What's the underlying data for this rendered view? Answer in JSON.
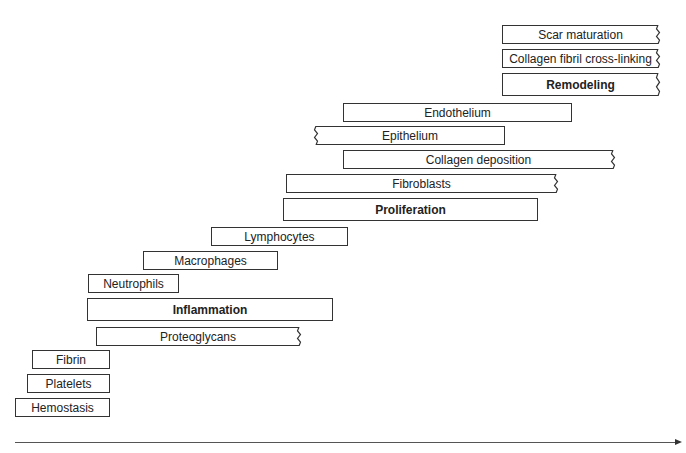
{
  "diagram": {
    "type": "wound-healing-phases-timeline",
    "bars": [
      {
        "label": "Scar maturation",
        "bold": false,
        "x": 502,
        "y": 25,
        "w": 156,
        "jag_right": true,
        "jag_left": false
      },
      {
        "label": "Collagen fibril cross-linking",
        "bold": false,
        "x": 502,
        "y": 49,
        "w": 156,
        "jag_right": true,
        "jag_left": false
      },
      {
        "label": "Remodeling",
        "bold": true,
        "x": 502,
        "y": 73,
        "w": 156,
        "jag_right": true,
        "jag_left": false
      },
      {
        "label": "Endothelium",
        "bold": false,
        "x": 343,
        "y": 103,
        "w": 229,
        "jag_right": false,
        "jag_left": false
      },
      {
        "label": "Epithelium",
        "bold": false,
        "x": 316,
        "y": 126,
        "w": 189,
        "jag_right": false,
        "jag_left": true
      },
      {
        "label": "Collagen deposition",
        "bold": false,
        "x": 343,
        "y": 150,
        "w": 270,
        "jag_right": true,
        "jag_left": false
      },
      {
        "label": "Fibroblasts",
        "bold": false,
        "x": 286,
        "y": 174,
        "w": 270,
        "jag_right": true,
        "jag_left": false
      },
      {
        "label": "Proliferation",
        "bold": true,
        "x": 283,
        "y": 198,
        "w": 255,
        "jag_right": false,
        "jag_left": false
      },
      {
        "label": "Lymphocytes",
        "bold": false,
        "x": 211,
        "y": 227,
        "w": 137,
        "jag_right": false,
        "jag_left": false
      },
      {
        "label": "Macrophages",
        "bold": false,
        "x": 143,
        "y": 251,
        "w": 135,
        "jag_right": false,
        "jag_left": false
      },
      {
        "label": "Neutrophils",
        "bold": false,
        "x": 88,
        "y": 274,
        "w": 91,
        "jag_right": false,
        "jag_left": false
      },
      {
        "label": "Inflammation",
        "bold": true,
        "x": 87,
        "y": 298,
        "w": 246,
        "jag_right": false,
        "jag_left": false
      },
      {
        "label": "Proteoglycans",
        "bold": false,
        "x": 96,
        "y": 327,
        "w": 203,
        "jag_right": true,
        "jag_left": false
      },
      {
        "label": "Fibrin",
        "bold": false,
        "x": 32,
        "y": 350,
        "w": 78,
        "jag_right": false,
        "jag_left": false
      },
      {
        "label": "Platelets",
        "bold": false,
        "x": 27,
        "y": 374,
        "w": 83,
        "jag_right": false,
        "jag_left": false
      },
      {
        "label": "Hemostasis",
        "bold": false,
        "x": 15,
        "y": 398,
        "w": 95,
        "jag_right": false,
        "jag_left": false
      }
    ],
    "axis": {
      "direction": "time",
      "arrow": "right"
    }
  }
}
